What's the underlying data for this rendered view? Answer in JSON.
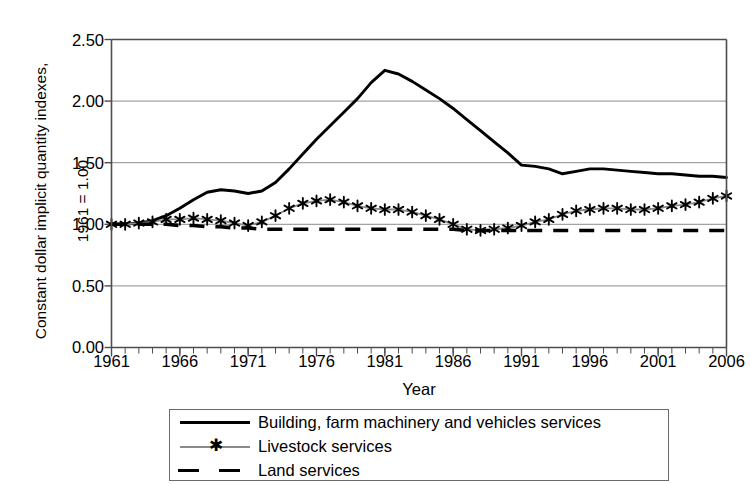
{
  "chart_data": {
    "type": "line",
    "title": "",
    "xlabel": "Year",
    "ylabel_line1": "Constant dollar implicit quantity indexes,",
    "ylabel_line2": "1961 = 1.00",
    "xlim": [
      1961,
      2006
    ],
    "ylim": [
      0.0,
      2.5
    ],
    "ytick_labels": [
      "0.00",
      "0.50",
      "1.00",
      "1.50",
      "2.00",
      "2.50"
    ],
    "ytick_values": [
      0.0,
      0.5,
      1.0,
      1.5,
      2.0,
      2.5
    ],
    "xtick_labels": [
      "1961",
      "1966",
      "1971",
      "1976",
      "1981",
      "1986",
      "1991",
      "1996",
      "2001",
      "2006"
    ],
    "xtick_values": [
      1961,
      1966,
      1971,
      1976,
      1981,
      1986,
      1991,
      1996,
      2001,
      2006
    ],
    "minor_xticks_every": 1,
    "grid": "horizontal",
    "legend_position": "below-plot",
    "x": [
      1961,
      1962,
      1963,
      1964,
      1965,
      1966,
      1967,
      1968,
      1969,
      1970,
      1971,
      1972,
      1973,
      1974,
      1975,
      1976,
      1977,
      1978,
      1979,
      1980,
      1981,
      1982,
      1983,
      1984,
      1985,
      1986,
      1987,
      1988,
      1989,
      1990,
      1991,
      1992,
      1993,
      1994,
      1995,
      1996,
      1997,
      1998,
      1999,
      2000,
      2001,
      2002,
      2003,
      2004,
      2005,
      2006
    ],
    "series": [
      {
        "name": "Building, farm machinery and vehicles services",
        "style": "solid",
        "color": "#000000",
        "marker": "none",
        "values": [
          1.0,
          1.0,
          1.01,
          1.03,
          1.07,
          1.13,
          1.2,
          1.26,
          1.28,
          1.27,
          1.25,
          1.27,
          1.34,
          1.45,
          1.57,
          1.69,
          1.8,
          1.91,
          2.02,
          2.15,
          2.25,
          2.22,
          2.16,
          2.09,
          2.02,
          1.94,
          1.85,
          1.76,
          1.67,
          1.58,
          1.48,
          1.47,
          1.45,
          1.41,
          1.43,
          1.45,
          1.45,
          1.44,
          1.43,
          1.42,
          1.41,
          1.41,
          1.4,
          1.39,
          1.39,
          1.38
        ]
      },
      {
        "name": "Livestock services",
        "style": "solid",
        "color": "#8a8a8a",
        "marker": "asterisk",
        "values": [
          1.0,
          1.0,
          1.01,
          1.02,
          1.04,
          1.04,
          1.05,
          1.04,
          1.03,
          1.01,
          0.99,
          1.02,
          1.07,
          1.13,
          1.17,
          1.19,
          1.2,
          1.18,
          1.15,
          1.13,
          1.12,
          1.12,
          1.1,
          1.07,
          1.04,
          1.0,
          0.96,
          0.95,
          0.96,
          0.97,
          0.99,
          1.02,
          1.04,
          1.08,
          1.11,
          1.12,
          1.13,
          1.13,
          1.12,
          1.12,
          1.13,
          1.15,
          1.16,
          1.18,
          1.21,
          1.23
        ]
      },
      {
        "name": "Land services",
        "style": "dashed",
        "color": "#000000",
        "marker": "none",
        "values": [
          1.0,
          1.0,
          1.0,
          1.0,
          1.0,
          0.99,
          0.99,
          0.98,
          0.98,
          0.97,
          0.97,
          0.96,
          0.96,
          0.96,
          0.96,
          0.96,
          0.96,
          0.96,
          0.96,
          0.96,
          0.96,
          0.96,
          0.96,
          0.96,
          0.96,
          0.96,
          0.95,
          0.95,
          0.95,
          0.95,
          0.95,
          0.95,
          0.95,
          0.95,
          0.95,
          0.95,
          0.95,
          0.95,
          0.95,
          0.95,
          0.95,
          0.95,
          0.95,
          0.95,
          0.95,
          0.95
        ]
      }
    ]
  },
  "legend": {
    "items": [
      {
        "label": "Building, farm machinery and vehicles services"
      },
      {
        "label": "Livestock services"
      },
      {
        "label": "Land services"
      }
    ]
  },
  "colors": {
    "axis": "#4d4d4d",
    "grid": "#8c8c8c",
    "series_primary": "#000000",
    "series_secondary": "#8a8a8a"
  }
}
